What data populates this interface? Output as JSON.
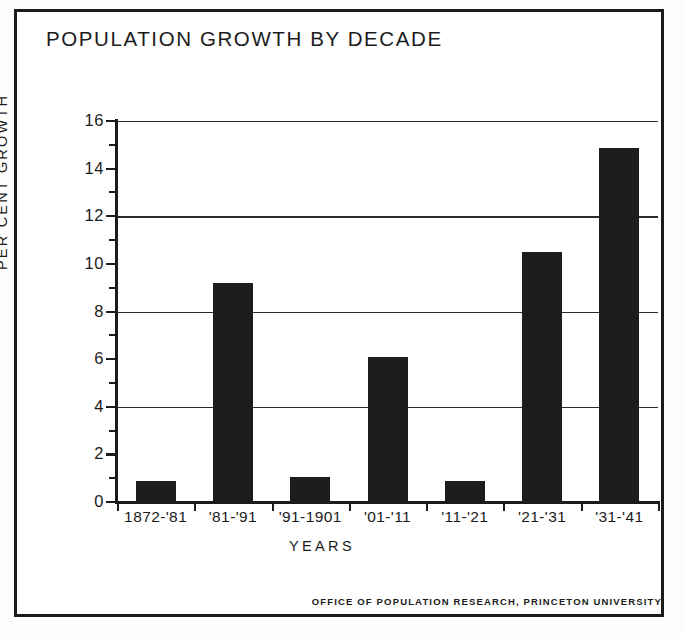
{
  "chart_data": {
    "type": "bar",
    "title": "POPULATION GROWTH BY DECADE",
    "xlabel": "YEARS",
    "ylabel": "PER CENT GROWTH",
    "categories": [
      "1872-'81",
      "'81-'91",
      "'91-1901",
      "'01-'11",
      "'11-'21",
      "'21-'31",
      "'31-'41"
    ],
    "values": [
      0.9,
      9.2,
      1.05,
      6.1,
      0.9,
      10.5,
      14.85
    ],
    "ylim": [
      0,
      16
    ],
    "ytick_labels": [
      "0",
      "2",
      "4",
      "6",
      "8",
      "10",
      "12",
      "14",
      "16"
    ],
    "ytick_values": [
      0,
      2,
      4,
      6,
      8,
      10,
      12,
      14,
      16
    ],
    "yminor_values": [
      1,
      3,
      5,
      7,
      9,
      11,
      13,
      15
    ],
    "gridlines": [
      4,
      8,
      12,
      16
    ],
    "grid": true,
    "legend": "none",
    "bar_color": "#1d1d1d",
    "axis_color": "#1b1b1b",
    "background": "#ffffff"
  },
  "credit": "OFFICE OF POPULATION RESEARCH, PRINCETON UNIVERSITY"
}
